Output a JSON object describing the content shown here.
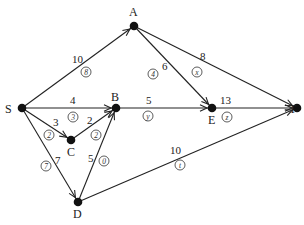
{
  "diagram": {
    "type": "flow-network",
    "nodes": [
      {
        "id": "S",
        "label": "S",
        "x": 22,
        "y": 108,
        "lx": 5,
        "ly": 113
      },
      {
        "id": "A",
        "label": "A",
        "x": 134,
        "y": 26,
        "lx": 129,
        "ly": 16
      },
      {
        "id": "B",
        "label": "B",
        "x": 116,
        "y": 108,
        "lx": 111,
        "ly": 101
      },
      {
        "id": "E",
        "label": "E",
        "x": 212,
        "y": 108,
        "lx": 208,
        "ly": 124
      },
      {
        "id": "T",
        "label": "T",
        "x": 297,
        "y": 108,
        "lx": 289,
        "ly": 113
      },
      {
        "id": "C",
        "label": "C",
        "x": 71,
        "y": 140,
        "lx": 67,
        "ly": 156
      },
      {
        "id": "D",
        "label": "D",
        "x": 78,
        "y": 202,
        "lx": 73,
        "ly": 218
      }
    ],
    "edges": [
      {
        "from": "S",
        "to": "A",
        "capacity": "10",
        "flow": "8",
        "cx": 72,
        "cy": 63,
        "fx": 86,
        "fy": 72
      },
      {
        "from": "S",
        "to": "B",
        "capacity": "4",
        "flow": "3",
        "cx": 70,
        "cy": 104,
        "fx": 73,
        "fy": 117
      },
      {
        "from": "S",
        "to": "C",
        "capacity": "3",
        "flow": "2",
        "cx": 53,
        "cy": 126,
        "fx": 49,
        "fy": 135
      },
      {
        "from": "S",
        "to": "D",
        "capacity": "7",
        "flow": "7",
        "cx": 55,
        "cy": 164,
        "fx": 46,
        "fy": 166
      },
      {
        "from": "C",
        "to": "B",
        "capacity": "2",
        "flow": "2",
        "cx": 87,
        "cy": 124,
        "fx": 96,
        "fy": 135
      },
      {
        "from": "D",
        "to": "B",
        "capacity": "5",
        "flow": "0",
        "cx": 88,
        "cy": 162,
        "fx": 104,
        "fy": 161
      },
      {
        "from": "A",
        "to": "E",
        "capacity": "6",
        "flow": "4",
        "cx": 162,
        "cy": 70,
        "fx": 153,
        "fy": 74
      },
      {
        "from": "A",
        "to": "T",
        "capacity": "8",
        "flow": "x",
        "cx": 200,
        "cy": 60,
        "fx": 197,
        "fy": 72
      },
      {
        "from": "B",
        "to": "E",
        "capacity": "5",
        "flow": "y",
        "cx": 146,
        "cy": 104,
        "fx": 148,
        "fy": 116
      },
      {
        "from": "E",
        "to": "T",
        "capacity": "13",
        "flow": "z",
        "cx": 220,
        "cy": 104,
        "fx": 227,
        "fy": 117
      },
      {
        "from": "D",
        "to": "T",
        "capacity": "10",
        "flow": "t",
        "cx": 170,
        "cy": 154,
        "fx": 180,
        "fy": 165
      }
    ]
  }
}
